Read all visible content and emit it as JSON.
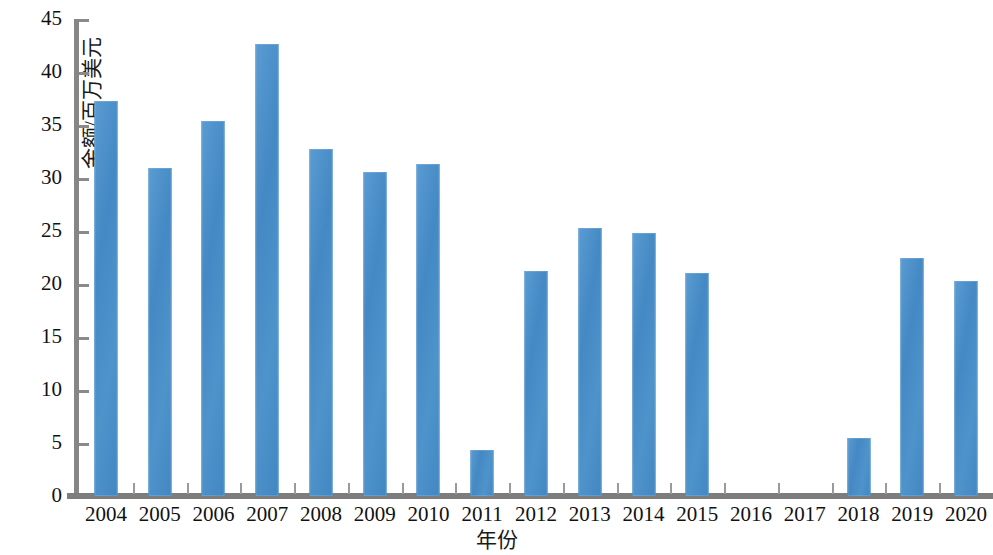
{
  "chart_data": {
    "type": "bar",
    "title": "",
    "xlabel": "年份",
    "ylabel": "金额/百万美元",
    "categories": [
      "2004",
      "2005",
      "2006",
      "2007",
      "2008",
      "2009",
      "2010",
      "2011",
      "2012",
      "2013",
      "2014",
      "2015",
      "2016",
      "2017",
      "2018",
      "2019",
      "2020"
    ],
    "values": [
      37.3,
      30.9,
      35.4,
      42.6,
      32.7,
      30.6,
      31.3,
      4.3,
      21.2,
      25.3,
      24.8,
      21.0,
      0,
      0,
      5.5,
      22.5,
      20.3
    ],
    "series": [
      {
        "name": "金额/百万美元",
        "values": [
          37.3,
          30.9,
          35.4,
          42.6,
          32.7,
          30.6,
          31.3,
          4.3,
          21.2,
          25.3,
          24.8,
          21.0,
          0,
          0,
          5.5,
          22.5,
          20.3
        ]
      }
    ],
    "ylim": [
      0,
      45
    ],
    "ytick_labels": [
      "0",
      "5",
      "10",
      "15",
      "20",
      "25",
      "30",
      "35",
      "40",
      "45"
    ],
    "ytick_values": [
      0,
      5,
      10,
      15,
      20,
      25,
      30,
      35,
      40,
      45
    ],
    "grid": false,
    "legend": "none",
    "bar_color": "#4a8fc8",
    "axis_color": "#868686",
    "text_color": "#111111"
  }
}
